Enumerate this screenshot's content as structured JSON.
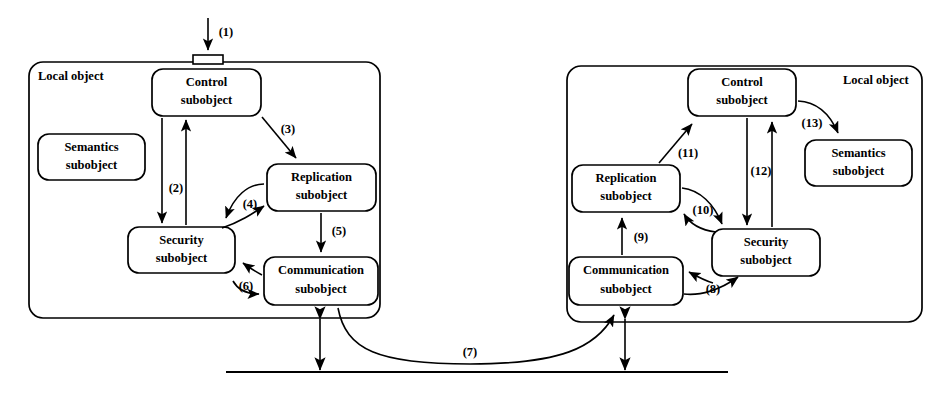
{
  "figure": {
    "background_color": "#ffffff",
    "line_color": "#000000"
  },
  "left_panel": {
    "label": "Local object",
    "boxes": {
      "control": {
        "line1": "Control",
        "line2": "subobject"
      },
      "semantics": {
        "line1": "Semantics",
        "line2": "subobject"
      },
      "replication": {
        "line1": "Replication",
        "line2": "subobject"
      },
      "security": {
        "line1": "Security",
        "line2": "subobject"
      },
      "communication": {
        "line1": "Communication",
        "line2": "subobject"
      }
    }
  },
  "right_panel": {
    "label": "Local object",
    "boxes": {
      "control": {
        "line1": "Control",
        "line2": "subobject"
      },
      "semantics": {
        "line1": "Semantics",
        "line2": "subobject"
      },
      "replication": {
        "line1": "Replication",
        "line2": "subobject"
      },
      "security": {
        "line1": "Security",
        "line2": "subobject"
      },
      "communication": {
        "line1": "Communication",
        "line2": "subobject"
      }
    }
  },
  "flow_labels": {
    "f1": "(1)",
    "f2": "(2)",
    "f3": "(3)",
    "f4": "(4)",
    "f5": "(5)",
    "f6": "(6)",
    "f7": "(7)",
    "f8": "(8)",
    "f9": "(9)",
    "f10": "(10)",
    "f11": "(11)",
    "f12": "(12)",
    "f13": "(13)"
  }
}
